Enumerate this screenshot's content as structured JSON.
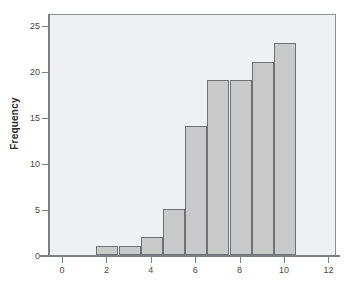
{
  "chart_data": {
    "type": "bar",
    "title": "",
    "subtitle": "",
    "xlabel": "",
    "ylabel": "Frequency",
    "grid": false,
    "legend": null,
    "xlim": [
      -0.6,
      12.6
    ],
    "ylim": [
      0,
      26
    ],
    "x_ticks": [
      "0",
      "2",
      "4",
      "6",
      "8",
      "10",
      "12"
    ],
    "x_tick_values": [
      0,
      2,
      4,
      6,
      8,
      10,
      12
    ],
    "y_ticks": [
      "0",
      "5",
      "10",
      "15",
      "20",
      "25"
    ],
    "y_tick_values": [
      0,
      5,
      10,
      15,
      20,
      25
    ],
    "bin_width": 1,
    "bin_edges": [
      1.5,
      2.5,
      3.5,
      4.5,
      5.5,
      6.5,
      7.5,
      8.5,
      9.5,
      10.5
    ],
    "categories": [
      "1.5-2.5",
      "2.5-3.5",
      "3.5-4.5",
      "4.5-5.5",
      "5.5-6.5",
      "6.5-7.5",
      "7.5-8.5",
      "8.5-9.5",
      "9.5-10.5"
    ],
    "bin_centers": [
      2,
      3,
      4,
      5,
      6,
      7,
      8,
      9,
      10
    ],
    "values": [
      1,
      1,
      2,
      5,
      14,
      19,
      19,
      21,
      23
    ],
    "bar_fill_color": "#c9c9c9",
    "bar_border_color": "#6e7074",
    "plot_background_color": "#eef0f2",
    "axis_color": "#7d8186",
    "figure_background_color": "#ffffff"
  }
}
